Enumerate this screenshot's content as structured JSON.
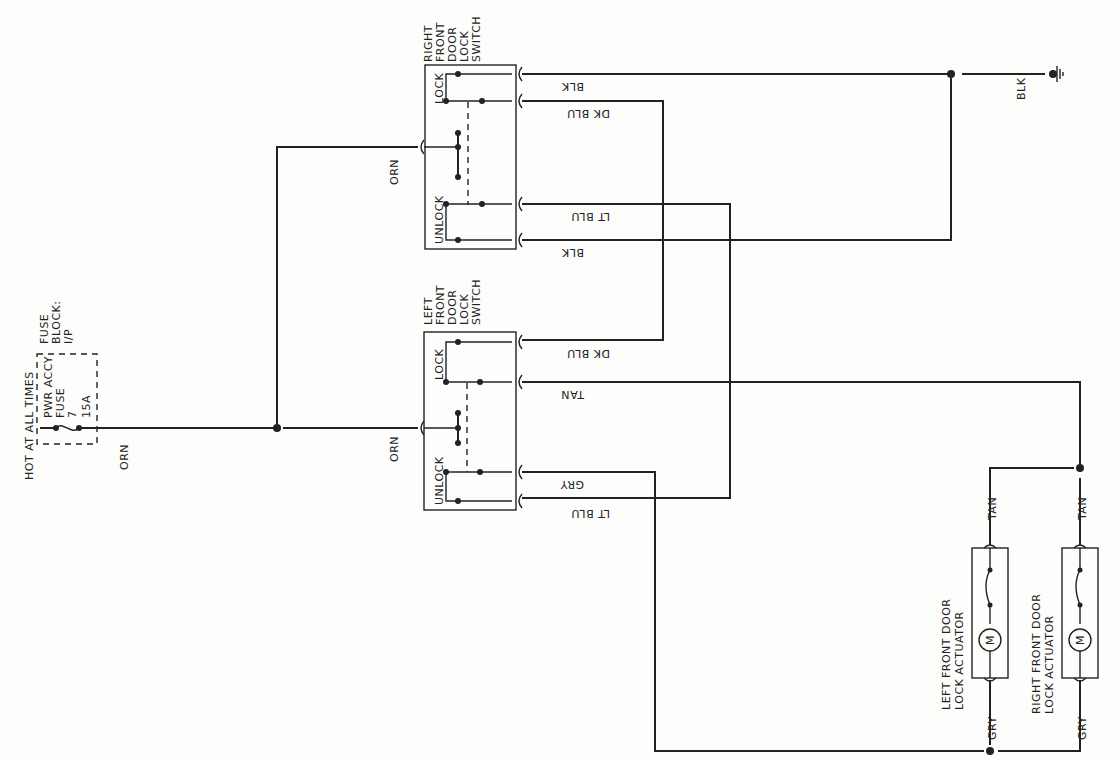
{
  "fuse_block": {
    "hot_label": "HOT AT ALL TIMES",
    "fuse_line1": "PWR ACCY",
    "fuse_line2": "FUSE",
    "fuse_line3": "7",
    "fuse_line4": "15A",
    "block_line1": "FUSE",
    "block_line2": "BLOCK:",
    "block_line3": "I/P",
    "out_wire": "ORN"
  },
  "right_switch": {
    "title": [
      "RIGHT",
      "FRONT",
      "DOOR",
      "LOCK",
      "SWITCH"
    ],
    "lock_label": "LOCK",
    "unlock_label": "UNLOCK",
    "in_wire": "ORN",
    "wires": [
      "BLK",
      "DK BLU",
      "LT BLU",
      "BLK"
    ]
  },
  "left_switch": {
    "title": [
      "LEFT",
      "FRONT",
      "DOOR",
      "LOCK",
      "SWITCH"
    ],
    "lock_label": "LOCK",
    "unlock_label": "UNLOCK",
    "in_wire": "ORN",
    "wires": [
      "DK BLU",
      "TAN",
      "GRY",
      "LT BLU"
    ]
  },
  "ground": {
    "wire": "BLK"
  },
  "left_actuator": {
    "title_line1": "LEFT FRONT DOOR",
    "title_line2": "LOCK ACTUATOR",
    "motor": "M",
    "top_wire": "TAN",
    "bottom_wire": "GRY"
  },
  "right_actuator": {
    "title_line1": "RIGHT FRONT DOOR",
    "title_line2": "LOCK ACTUATOR",
    "motor": "M",
    "top_wire": "TAN",
    "bottom_wire": "GRY"
  }
}
